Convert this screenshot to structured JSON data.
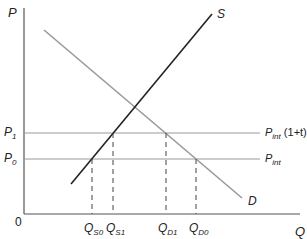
{
  "diagram": {
    "type": "supply-demand-tariff",
    "axes": {
      "y_label": "P",
      "x_label": "Q",
      "origin_label": "0"
    },
    "curves": {
      "supply_label": "S",
      "demand_label": "D"
    },
    "price_levels": {
      "p1_label_main": "P",
      "p1_label_sub": "1",
      "p0_label_main": "P",
      "p0_label_sub": "0",
      "p_int_tariff_main": "P",
      "p_int_tariff_sub": "int",
      "p_int_tariff_suffix": " (1+t)",
      "p_int_main": "P",
      "p_int_sub": "int"
    },
    "quantities": [
      {
        "main": "Q",
        "sub": "S0"
      },
      {
        "main": "Q",
        "sub": "S1"
      },
      {
        "main": "Q",
        "sub": "D1"
      },
      {
        "main": "Q",
        "sub": "D0"
      }
    ],
    "colors": {
      "axis": "#555555",
      "supply": "#222222",
      "demand": "#999999",
      "price_line": "#999999",
      "dashed": "#444444"
    }
  }
}
